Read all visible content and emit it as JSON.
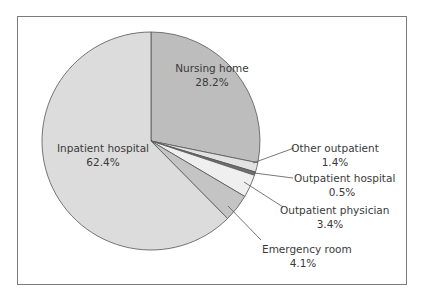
{
  "chart_data": {
    "type": "pie",
    "title": "",
    "start_angle": "12 o'clock, clockwise",
    "slices": [
      {
        "label": "Nursing home",
        "value": 28.2,
        "value_label": "28.2%",
        "color": "#bdbdbd"
      },
      {
        "label": "Other outpatient",
        "value": 1.4,
        "value_label": "1.4%",
        "color": "#e2e2e2"
      },
      {
        "label": "Outpatient hospital",
        "value": 0.5,
        "value_label": "0.5%",
        "color": "#6e6e6e"
      },
      {
        "label": "Outpatient physician",
        "value": 3.4,
        "value_label": "3.4%",
        "color": "#efefef"
      },
      {
        "label": "Emergency room",
        "value": 4.1,
        "value_label": "4.1%",
        "color": "#c4c4c4"
      },
      {
        "label": "Inpatient hospital",
        "value": 62.4,
        "value_label": "62.4%",
        "color": "#dcdcdc"
      }
    ],
    "legend": "none (labels placed on / beside slices with leader lines)"
  },
  "labels": {
    "nursing_home": {
      "name": "Nursing home",
      "pct": "28.2%"
    },
    "inpatient_hospital": {
      "name": "Inpatient hospital",
      "pct": "62.4%"
    },
    "other_outpatient": {
      "name": "Other outpatient",
      "pct": "1.4%"
    },
    "outpatient_hospital": {
      "name": "Outpatient hospital",
      "pct": "0.5%"
    },
    "outpatient_physician": {
      "name": "Outpatient physician",
      "pct": "3.4%"
    },
    "emergency_room": {
      "name": "Emergency room",
      "pct": "4.1%"
    }
  }
}
